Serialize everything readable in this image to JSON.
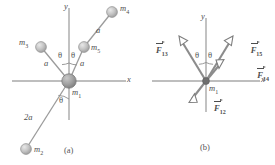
{
  "figure": {
    "panels": [
      {
        "id": "a",
        "caption": "(a)",
        "axes": {
          "x_label": "x",
          "y_label": "y"
        },
        "center_mass_label": "m",
        "center_mass_sub": "1",
        "masses": [
          {
            "name": "m3",
            "label": "m",
            "sub": "3",
            "distance_label": "a"
          },
          {
            "name": "m5",
            "label": "m",
            "sub": "5",
            "distance_label": "a"
          },
          {
            "name": "m4",
            "label": "m",
            "sub": "4",
            "distance_label": "a"
          },
          {
            "name": "m2",
            "label": "m",
            "sub": "2",
            "distance_label": "2a"
          }
        ],
        "angles": [
          {
            "name": "theta-left-upper",
            "label": "θ"
          },
          {
            "name": "theta-right-upper",
            "label": "θ"
          },
          {
            "name": "theta-lower",
            "label": "θ"
          }
        ]
      },
      {
        "id": "b",
        "caption": "(b)",
        "axes": {
          "x_label": "x",
          "y_label": "y"
        },
        "center_mass_label": "m",
        "center_mass_sub": "1",
        "forces": [
          {
            "name": "F13",
            "label": "F",
            "sub": "13"
          },
          {
            "name": "F15",
            "label": "F",
            "sub": "15"
          },
          {
            "name": "F14",
            "label": "F",
            "sub": "14"
          },
          {
            "name": "F12",
            "label": "F",
            "sub": "12"
          }
        ],
        "angles": [
          {
            "name": "theta-left",
            "label": "θ"
          },
          {
            "name": "theta-right",
            "label": "θ"
          }
        ]
      }
    ],
    "colors": {
      "axis": "#a8a8a8",
      "line": "#9b9b9b",
      "vector": "#8c8c8c",
      "mass_fill": "#b9b9b9",
      "center_mass_fill": "#9a9a9a",
      "text": "#4d4d4d"
    }
  }
}
